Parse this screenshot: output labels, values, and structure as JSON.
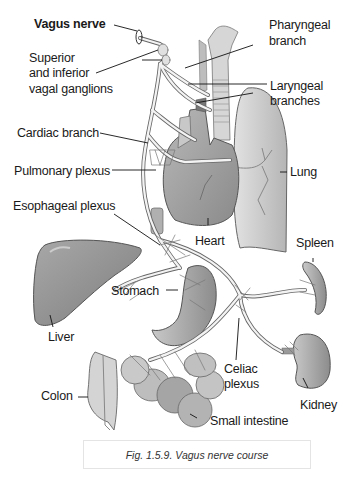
{
  "figure": {
    "caption": "Fig. 1.5.9. Vagus nerve course"
  },
  "labels": {
    "vagus_nerve": "Vagus nerve",
    "ganglia_line1": "Superior",
    "ganglia_line2": "and inferior",
    "ganglia_line3": "vagal ganglions",
    "pharyngeal_line1": "Pharyngeal",
    "pharyngeal_line2": "branch",
    "laryngeal_line1": "Laryngeal",
    "laryngeal_line2": "branches",
    "cardiac_branch": "Cardiac branch",
    "pulmonary_plexus": "Pulmonary plexus",
    "esophageal_plexus": "Esophageal plexus",
    "lung": "Lung",
    "heart": "Heart",
    "spleen": "Spleen",
    "stomach": "Stomach",
    "liver": "Liver",
    "celiac_line1": "Celiac",
    "celiac_line2": "plexus",
    "kidney": "Kidney",
    "colon": "Colon",
    "small_intestine": "Small intestine"
  },
  "colors": {
    "organ_fill": "#9a9a9a",
    "organ_light": "#cfcfcf",
    "nerve": "#f2f2f2",
    "outline": "#5a5a5a",
    "text": "#1a1a1a"
  }
}
